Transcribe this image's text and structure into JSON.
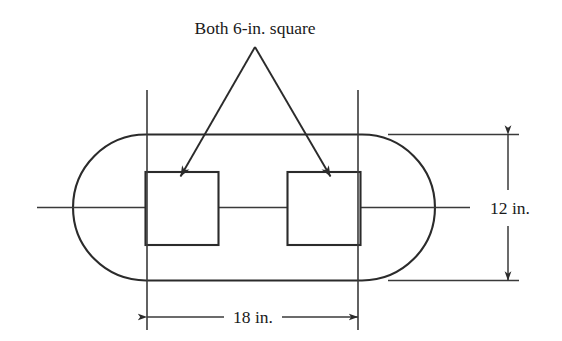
{
  "figure": {
    "title_note": "Both 6-in. square",
    "dimensions": {
      "width_label": "18 in.",
      "height_label": "12 in."
    },
    "colors": {
      "fill_gray": "#c9c9c9",
      "outline": "#2b2b2b",
      "hole_fill": "#ffffff",
      "text": "#1a1a1a",
      "background": "#ffffff"
    },
    "geometry": {
      "shape": "obround",
      "overall_width_in": 18,
      "overall_height_in": 12,
      "hole_count": 2,
      "hole_shape": "square",
      "hole_size_in": 6
    },
    "annotations": {
      "leader_apex_label": "leader-apex",
      "left_arrow_target": "left-square-hole",
      "right_arrow_target": "right-square-hole"
    }
  }
}
